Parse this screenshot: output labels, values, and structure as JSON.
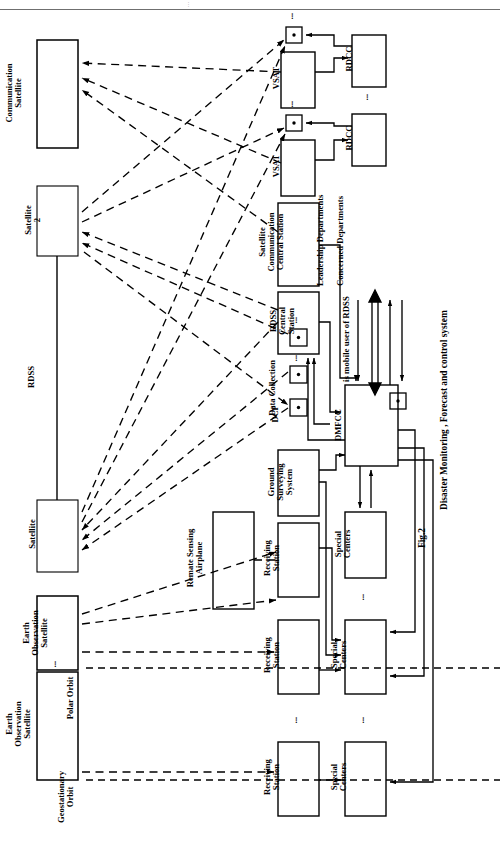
{
  "figure": {
    "number": "Fig.2",
    "caption": "Disaster Monitoring , Forecast and control system",
    "legend_text": "is mobile user of RDSS",
    "legend_symbol": "mobile-user-square-dot"
  },
  "orbits": {
    "geostationary": "Geostationary\nOrbit",
    "polar": "Polar Orbit",
    "rdss_link": "RDSS"
  },
  "space_segment": [
    {
      "id": "earth-obs-sat-1",
      "label": "Earth\nObservation\nSatellite"
    },
    {
      "id": "earth-obs-sat-2",
      "label": "Earth\nObservation\nSatellite"
    },
    {
      "id": "satellite-1",
      "label": "Satellite"
    },
    {
      "id": "satellite-2",
      "label": "Satellite\n2"
    },
    {
      "id": "communication-satellite",
      "label": "Communication\nSatellite"
    }
  ],
  "air_segment": [
    {
      "id": "remote-sensing-airplane",
      "label": "Remate Sensing\nAirplane"
    }
  ],
  "ground_stations": [
    {
      "id": "receiving-station-1",
      "label": "Receiving\nStation"
    },
    {
      "id": "receiving-station-2",
      "label": "Receiving\nStation"
    },
    {
      "id": "receiving-station-3",
      "label": "Receiving\nStation"
    },
    {
      "id": "receiving-station-4",
      "label": "Receiving\nStation"
    }
  ],
  "special_centers": [
    {
      "id": "special-centers-1",
      "label": "Special\nCenters"
    },
    {
      "id": "special-centers-2",
      "label": "Special\nCenters"
    },
    {
      "id": "special-centers-3",
      "label": "Special\nCenters"
    }
  ],
  "data_collection": {
    "dcp_label": "DCP",
    "group_label": "Data Collection",
    "platform_count": 3
  },
  "central_nodes": [
    {
      "id": "ground-surveying-system",
      "label": "Ground\nSurveying\nSystem"
    },
    {
      "id": "rdss-central-station",
      "label": "RDSS\nCentral\nStation"
    },
    {
      "id": "satellite-comm-central-station",
      "label": "Satellite\nCommunication\nCentral Station"
    },
    {
      "id": "dmfcc",
      "label": "DMFCC"
    }
  ],
  "vsat_nodes": [
    {
      "id": "vsat-1",
      "label": "VSAT"
    },
    {
      "id": "vsat-2",
      "label": "VSAT"
    }
  ],
  "rdcc_nodes": [
    {
      "id": "rdcc-1",
      "label": "RDCC"
    },
    {
      "id": "rdcc-2",
      "label": "RDCC"
    }
  ],
  "departments": [
    {
      "id": "leadership-departments",
      "label": "Leadership Departments",
      "arrow": "double-headed"
    },
    {
      "id": "concerned-departments",
      "label": "Concerned Departments",
      "arrow": "bidirectional-pair"
    }
  ],
  "ellipses": {
    "between_earth_obs": "...",
    "between_receiving_stations": "...",
    "between_special_centers": "...",
    "between_rdcc": "...",
    "above_mobile_user": "...",
    "between_dcp": "..."
  },
  "colors": {
    "stroke": "#000000",
    "background": "#ffffff",
    "header_rule": "#6f6f6f"
  }
}
